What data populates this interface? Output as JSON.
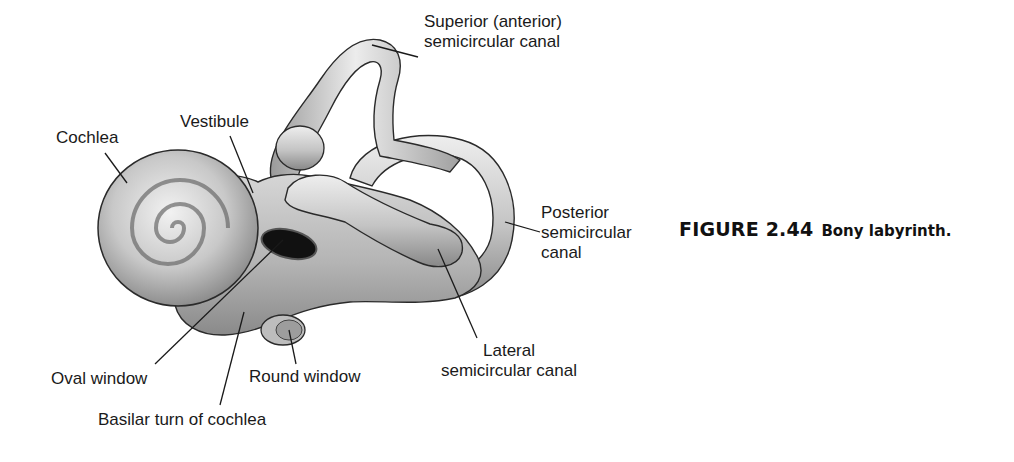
{
  "figure": {
    "number": "FIGURE 2.44",
    "title": "Bony labyrinth."
  },
  "labels": {
    "superior_canal": [
      "Superior (anterior)",
      "semicircular canal"
    ],
    "cochlea": "Cochlea",
    "vestibule": "Vestibule",
    "posterior_canal": [
      "Posterior",
      "semicircular",
      "canal"
    ],
    "lateral_canal": [
      "Lateral",
      "semicircular canal"
    ],
    "oval_window": "Oval window",
    "round_window": "Round window",
    "basilar_turn": "Basilar turn of cochlea"
  },
  "colors": {
    "structure_fill": "#c9c9c9",
    "outline": "#2a2a2a",
    "text": "#1a1a1a"
  }
}
